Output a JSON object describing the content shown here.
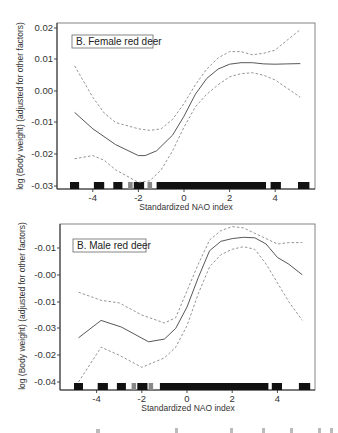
{
  "chart_data": [
    {
      "type": "line",
      "panel": "top",
      "legend_label": "B. Female red deer",
      "xlabel": "Standardized NAO index",
      "ylabel": "log (Body weight) (adjusted for other factors)",
      "x_ticks": [
        -4,
        -2,
        0,
        2,
        4
      ],
      "x_tick_labels": [
        "-4",
        "-2",
        "0",
        "2",
        "4"
      ],
      "y_ticks": [
        0.02,
        0.01,
        0.0,
        -0.01,
        -0.02,
        -0.03
      ],
      "y_tick_labels": [
        "0.02",
        "0.01",
        "0.00",
        "-0.01",
        "-0.02",
        "-0.03"
      ],
      "xlim": [
        -5.2,
        5.8
      ],
      "ylim": [
        -0.031,
        0.021
      ],
      "grid": false,
      "series": [
        {
          "name": "fit",
          "style": "solid",
          "x": [
            -4.8,
            -4,
            -3,
            -2,
            -1.7,
            -1.2,
            -0.5,
            0,
            0.5,
            1,
            1.5,
            2,
            2.5,
            3,
            3.5,
            4,
            4.5,
            5.1
          ],
          "y": [
            -0.0068,
            -0.012,
            -0.017,
            -0.0205,
            -0.0205,
            -0.019,
            -0.014,
            -0.008,
            -0.001,
            0.004,
            0.007,
            0.0085,
            0.009,
            0.009,
            0.0086,
            0.0085,
            0.0086,
            0.0087
          ]
        },
        {
          "name": "upper confidence band",
          "style": "dashed",
          "x": [
            -4.8,
            -4,
            -3.5,
            -3,
            -2,
            -1.5,
            -1,
            -0.5,
            0,
            0.5,
            1,
            1.5,
            2,
            2.5,
            3,
            3.5,
            4,
            4.5,
            5.1
          ],
          "y": [
            0.008,
            -0.002,
            -0.007,
            -0.01,
            -0.012,
            -0.0125,
            -0.012,
            -0.009,
            -0.004,
            0.002,
            0.007,
            0.0105,
            0.0125,
            0.0125,
            0.0115,
            0.012,
            0.013,
            0.016,
            0.0195
          ]
        },
        {
          "name": "lower confidence band",
          "style": "dashed",
          "x": [
            -4.8,
            -4,
            -3.5,
            -3,
            -2,
            -1.5,
            -1,
            -0.5,
            0,
            0.5,
            1,
            1.5,
            2,
            2.5,
            3,
            3.5,
            4,
            4.5,
            5.1
          ],
          "y": [
            -0.0215,
            -0.0205,
            -0.022,
            -0.025,
            -0.029,
            -0.0285,
            -0.025,
            -0.019,
            -0.0115,
            -0.005,
            -0.001,
            0.002,
            0.0045,
            0.0055,
            0.0058,
            0.005,
            0.0035,
            0.001,
            -0.002
          ]
        }
      ],
      "rug": [
        {
          "x0": -5.0,
          "x1": -4.6,
          "shade": "dark"
        },
        {
          "x0": -3.95,
          "x1": -3.5,
          "shade": "dark"
        },
        {
          "x0": -3.1,
          "x1": -2.7,
          "shade": "dark"
        },
        {
          "x0": -2.45,
          "x1": -2.25,
          "shade": "light"
        },
        {
          "x0": -2.2,
          "x1": -1.75,
          "shade": "dark"
        },
        {
          "x0": -1.6,
          "x1": -1.4,
          "shade": "light"
        },
        {
          "x0": -1.2,
          "x1": 3.6,
          "shade": "dark"
        },
        {
          "x0": 3.8,
          "x1": 4.25,
          "shade": "dark"
        },
        {
          "x0": 5.0,
          "x1": 5.5,
          "shade": "dark"
        }
      ]
    },
    {
      "type": "line",
      "panel": "bottom",
      "legend_label": "B. Male red deer",
      "xlabel": "Standardized NAO index",
      "ylabel": "log (Body weight) (adjusted for other factors)",
      "x_ticks": [
        -4,
        -2,
        0,
        2,
        4
      ],
      "x_tick_labels": [
        "-4",
        "-2",
        "0",
        "2",
        "4"
      ],
      "y_tick_labels": [
        "-0.01",
        "-0.00",
        "-0.01",
        "-0.03",
        "-0.02",
        "-0.04"
      ],
      "y_note": "y values expressed as tick-index position (0 = top tick '-0.01', 5 = bottom tick '-0.04'); tick labels as printed",
      "xlim": [
        -5.2,
        5.8
      ],
      "ylim_tick_index": [
        5.35,
        -1.1
      ],
      "grid": false,
      "series": [
        {
          "name": "fit",
          "style": "solid",
          "x": [
            -4.8,
            -3.8,
            -2.9,
            -1.7,
            -1,
            -0.5,
            0,
            0.5,
            1,
            1.5,
            2,
            2.5,
            3,
            3.5,
            4,
            4.5,
            5.1
          ],
          "y": [
            3.35,
            2.7,
            2.95,
            3.5,
            3.4,
            3.0,
            2.2,
            1.1,
            0.1,
            -0.25,
            -0.35,
            -0.4,
            -0.38,
            -0.15,
            0.35,
            0.6,
            1.0
          ]
        },
        {
          "name": "upper confidence band",
          "style": "dashed",
          "x": [
            -4.8,
            -3.8,
            -3,
            -2,
            -1,
            -0.5,
            0,
            0.5,
            1,
            1.5,
            2,
            2.5,
            3,
            3.5,
            4,
            4.5,
            5.1
          ],
          "y": [
            1.65,
            1.95,
            2.05,
            2.5,
            2.8,
            2.6,
            1.6,
            0.6,
            -0.3,
            -0.65,
            -0.8,
            -0.75,
            -0.55,
            -0.35,
            -0.15,
            -0.2,
            -0.2
          ]
        },
        {
          "name": "lower confidence band",
          "style": "dashed",
          "x": [
            -4.8,
            -3.8,
            -3,
            -2,
            -1,
            -0.5,
            0,
            0.5,
            1,
            1.5,
            2,
            2.5,
            3,
            3.5,
            4,
            4.5,
            5.1
          ],
          "y": [
            5.0,
            3.7,
            4.0,
            4.45,
            4.1,
            3.7,
            2.9,
            1.7,
            0.7,
            0.25,
            0.05,
            -0.05,
            0.05,
            0.6,
            1.3,
            2.0,
            2.7
          ]
        }
      ],
      "rug": [
        {
          "x0": -5.0,
          "x1": -4.6,
          "shade": "dark"
        },
        {
          "x0": -3.95,
          "x1": -3.5,
          "shade": "dark"
        },
        {
          "x0": -3.1,
          "x1": -2.7,
          "shade": "dark"
        },
        {
          "x0": -2.45,
          "x1": -2.25,
          "shade": "light"
        },
        {
          "x0": -2.2,
          "x1": -1.75,
          "shade": "dark"
        },
        {
          "x0": -1.7,
          "x1": -1.5,
          "shade": "light"
        },
        {
          "x0": -1.2,
          "x1": 3.6,
          "shade": "dark"
        },
        {
          "x0": 3.75,
          "x1": 4.2,
          "shade": "dark"
        },
        {
          "x0": 4.95,
          "x1": 5.45,
          "shade": "dark"
        }
      ]
    }
  ],
  "panels": {
    "female": {
      "legend": "B. Female red deer",
      "xlabel": "Standardized NAO index",
      "ylabel": "log (Body weight) (adjusted for other factors)",
      "y_tick_labels": [
        "0.02",
        "0.01",
        "0.00",
        "-0.01",
        "-0.02",
        "-0.03"
      ],
      "x_tick_labels": [
        "-4",
        "-2",
        "0",
        "2",
        "4"
      ]
    },
    "male": {
      "legend": "B. Male red deer",
      "xlabel": "Standardized NAO index",
      "ylabel": "log (Body weight) (adjusted for other factors)",
      "y_tick_labels": [
        "-0.01",
        "-0.00",
        "-0.01",
        "-0.03",
        "-0.02",
        "-0.04"
      ],
      "x_tick_labels": [
        "-4",
        "-2",
        "0",
        "2",
        "4"
      ]
    }
  },
  "colors": {
    "fit_line": "#444444",
    "ci_line": "#888888",
    "frame": "#777777",
    "rug_dark": "#111111",
    "rug_light": "#888888",
    "background": "#ffffff"
  }
}
